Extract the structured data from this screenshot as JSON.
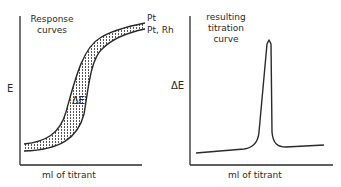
{
  "left_panel": {
    "title_line1": "Response",
    "title_line2": "curves",
    "y_label": "E",
    "x_label": "ml of titrant",
    "band_label": "ΔE",
    "curve_upper_label": "Pt",
    "curve_lower_label": "Pt, Rh"
  },
  "right_panel": {
    "title_line1": "resulting",
    "title_line2": "titration",
    "title_line3": "curve",
    "y_label": "ΔE",
    "x_label": "ml of titrant"
  },
  "colors": {
    "line": "#2a2a2a",
    "background": "#ffffff"
  }
}
